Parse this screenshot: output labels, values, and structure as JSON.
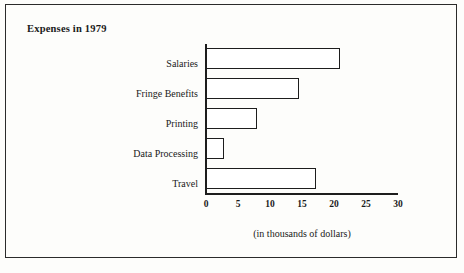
{
  "figure": {
    "title": "Expenses in 1979",
    "axis_caption": "(in thousands of dollars)",
    "frame_color": "#2b2b2b",
    "bar_outline_color": "#1d1d1d",
    "bar_fill_color": "#ffffff",
    "background_color": "#fdfdfb"
  },
  "chart_data": {
    "type": "bar",
    "orientation": "horizontal",
    "title": "Expenses in 1979",
    "xlabel": "(in thousands of dollars)",
    "ylabel": "",
    "categories": [
      "Salaries",
      "Fringe Benefits",
      "Printing",
      "Data Processing",
      "Travel"
    ],
    "values": [
      21,
      14.5,
      8,
      2.8,
      17.2
    ],
    "xlim": [
      0,
      30
    ],
    "xticks": [
      0,
      5,
      10,
      15,
      20,
      25,
      30
    ],
    "xtick_labels": [
      "0",
      "5",
      "10",
      "15",
      "20",
      "25",
      "30"
    ],
    "units": "thousands of dollars",
    "grid": false,
    "legend": false
  }
}
